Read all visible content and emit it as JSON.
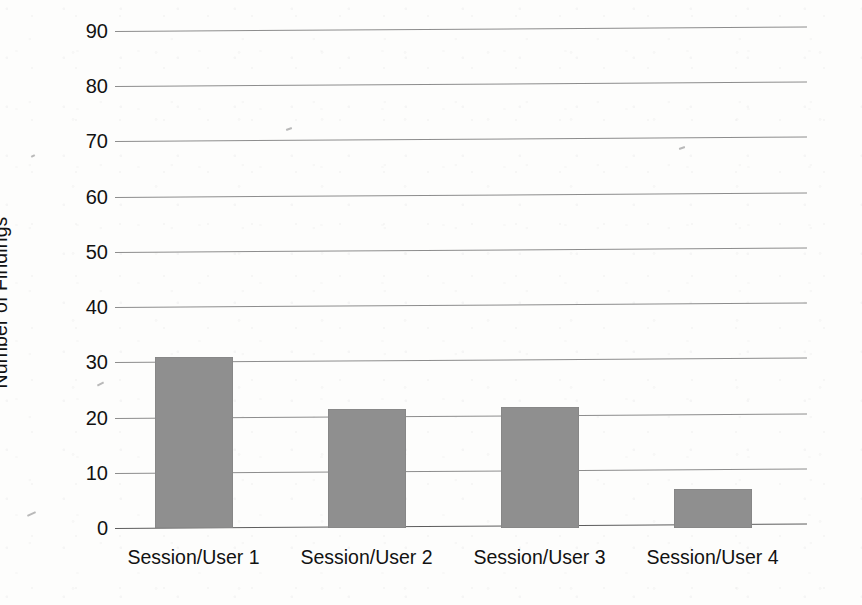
{
  "chart_data": {
    "type": "bar",
    "title": "",
    "subtitle": "",
    "xlabel": "",
    "ylabel": "Number of Findings",
    "categories": [
      "Session/User 1",
      "Session/User 2",
      "Session/User 3",
      "Session/User 4"
    ],
    "values": [
      31,
      21.5,
      22,
      7
    ],
    "series": [
      {
        "name": "Number of Findings",
        "values": [
          31,
          21.5,
          22,
          7
        ]
      }
    ],
    "ylim": [
      0,
      92
    ],
    "yticks": [
      0,
      10,
      20,
      30,
      40,
      50,
      60,
      70,
      80,
      90
    ],
    "ytick_labels": [
      "0",
      "10",
      "20",
      "30",
      "40",
      "50",
      "60",
      "70",
      "80",
      "90"
    ],
    "grid": true,
    "grid_axis": "y",
    "legend": false,
    "legend_position": "none",
    "bar_color": "#8f8f8f",
    "grid_color": "#8d8d8d",
    "axis_color": "#5d5d5d",
    "text_color": "#121212",
    "background_color": "#fdfdfc",
    "annotations": []
  }
}
